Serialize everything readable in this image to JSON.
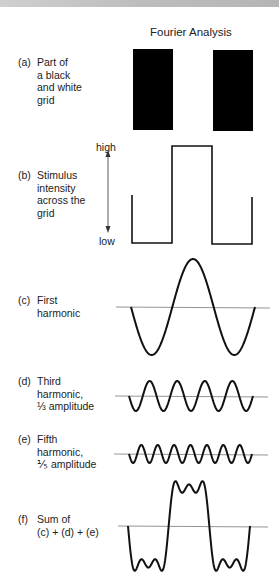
{
  "figure": {
    "title": "Fourier Analysis",
    "panels": {
      "a": {
        "tag": "(a)",
        "lines": [
          "Part of",
          "a black",
          "and white",
          "grid"
        ]
      },
      "b": {
        "tag": "(b)",
        "lines": [
          "Stimulus",
          "intensity",
          "across the",
          "grid"
        ],
        "axis_high": "high",
        "axis_low": "low"
      },
      "c": {
        "tag": "(c)",
        "lines": [
          "First",
          "harmonic"
        ]
      },
      "d": {
        "tag": "(d)",
        "lines": [
          "Third",
          "harmonic,",
          "⅓ amplitude"
        ]
      },
      "e": {
        "tag": "(e)",
        "lines": [
          "Fifth",
          "harmonic,",
          "⅕ amplitude"
        ]
      },
      "f": {
        "tag": "(f)",
        "lines": [
          "Sum of",
          "(c) + (d) + (e)"
        ]
      }
    },
    "footer": "See Figure 5.3..."
  },
  "colors": {
    "ink": "#111111",
    "baseline": "#888888",
    "bar": "#000000"
  }
}
